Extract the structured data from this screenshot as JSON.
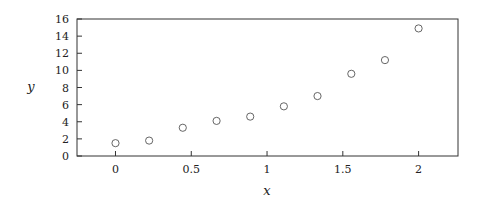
{
  "chart_data": {
    "type": "scatter",
    "title": "",
    "xlabel": "x",
    "ylabel": "y",
    "xlim": [
      -0.254,
      2.26
    ],
    "ylim": [
      0,
      16
    ],
    "xticks": [
      0,
      0.5,
      1,
      1.5,
      2
    ],
    "xtick_labels": [
      "0",
      "0.5",
      "1",
      "1.5",
      "2"
    ],
    "yticks": [
      0,
      2,
      4,
      6,
      8,
      10,
      12,
      14,
      16
    ],
    "ytick_labels": [
      "0",
      "2",
      "4",
      "6",
      "8",
      "10",
      "12",
      "14",
      "16"
    ],
    "grid": false,
    "legend": null,
    "marker": "open-circle",
    "series": [
      {
        "name": "data",
        "x": [
          0,
          0.222,
          0.444,
          0.667,
          0.889,
          1.111,
          1.333,
          1.556,
          1.778,
          2.0
        ],
        "y": [
          1.5,
          1.8,
          3.3,
          4.1,
          4.6,
          5.8,
          7.0,
          9.6,
          11.2,
          14.9
        ],
        "color": "#555555"
      }
    ]
  }
}
